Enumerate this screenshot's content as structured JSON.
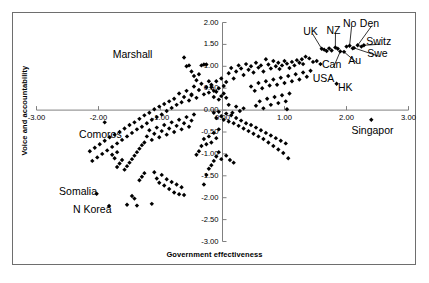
{
  "chart_data": {
    "type": "scatter",
    "title": "",
    "xlabel": "Government effectiveness",
    "ylabel": "Voice and accountability",
    "xlim": [
      -3.0,
      3.0
    ],
    "ylim": [
      -3.0,
      2.0
    ],
    "xticks": [
      "-3.00",
      "-2.00",
      "-1.00",
      "0.00",
      "1.00",
      "2.00",
      "3.00"
    ],
    "xtick_values": [
      -3.0,
      -2.0,
      -1.0,
      0.0,
      1.0,
      2.0,
      3.0
    ],
    "yticks": [
      "2.00",
      "1.50",
      "1.00",
      "0.50",
      "0.00",
      "-0.50",
      "-1.00",
      "-1.50",
      "-2.00",
      "-2.50",
      "-3.00"
    ],
    "ytick_values": [
      2.0,
      1.5,
      1.0,
      0.5,
      0.0,
      -0.5,
      -1.0,
      -1.5,
      -2.0,
      -2.5,
      -3.0
    ],
    "grid": false,
    "legend": "none",
    "marker": "diamond",
    "marker_color": "#000000",
    "axis_color": "#808080",
    "annotations": [
      {
        "label": "Marshall",
        "lx": -1.45,
        "ly": 1.25,
        "px": -0.62,
        "py": 1.2,
        "leader": false
      },
      {
        "label": "Comoros",
        "lx": -1.97,
        "ly": -0.56,
        "px": -1.9,
        "py": -0.28,
        "leader": false
      },
      {
        "label": "Somalia",
        "lx": -2.33,
        "ly": -1.88,
        "px": -2.03,
        "py": -1.91,
        "leader": false
      },
      {
        "label": "N Korea",
        "lx": -2.1,
        "ly": -2.28,
        "px": -1.83,
        "py": -2.19,
        "leader": false
      },
      {
        "label": "Singapor",
        "lx": 2.42,
        "ly": -0.48,
        "px": 2.4,
        "py": -0.22,
        "leader": false
      },
      {
        "label": "UK",
        "lx": 1.42,
        "ly": 1.79,
        "px": 1.6,
        "py": 1.4,
        "leader": true
      },
      {
        "label": "NZ",
        "lx": 1.79,
        "ly": 1.8,
        "px": 1.82,
        "py": 1.43,
        "leader": true
      },
      {
        "label": "No",
        "lx": 2.05,
        "ly": 1.96,
        "px": 2.05,
        "py": 1.47,
        "leader": true
      },
      {
        "label": "Den",
        "lx": 2.37,
        "ly": 1.96,
        "px": 2.18,
        "py": 1.48,
        "leader": true
      },
      {
        "label": "Switz",
        "lx": 2.52,
        "ly": 1.55,
        "px": 2.28,
        "py": 1.48,
        "leader": true
      },
      {
        "label": "Swe",
        "lx": 2.5,
        "ly": 1.27,
        "px": 2.12,
        "py": 1.42,
        "leader": true
      },
      {
        "label": "Au",
        "lx": 2.13,
        "ly": 1.13,
        "px": 1.96,
        "py": 1.33,
        "leader": true
      },
      {
        "label": "Can",
        "lx": 1.76,
        "ly": 1.03,
        "px": 1.9,
        "py": 1.34,
        "leader": true
      },
      {
        "label": "USA",
        "lx": 1.63,
        "ly": 0.72,
        "px": 1.58,
        "py": 1.05,
        "leader": false
      },
      {
        "label": "HK",
        "lx": 1.98,
        "ly": 0.5,
        "px": 1.84,
        "py": 0.6,
        "leader": false
      }
    ],
    "points": [
      [
        -2.03,
        -1.91
      ],
      [
        -1.83,
        -2.19
      ],
      [
        -1.9,
        -0.28
      ],
      [
        -0.62,
        1.2
      ],
      [
        2.4,
        -0.22
      ],
      [
        1.6,
        1.4
      ],
      [
        1.64,
        1.38
      ],
      [
        1.68,
        1.35
      ],
      [
        1.72,
        1.41
      ],
      [
        1.76,
        1.36
      ],
      [
        1.82,
        1.43
      ],
      [
        1.86,
        1.4
      ],
      [
        1.9,
        1.34
      ],
      [
        1.96,
        1.33
      ],
      [
        2.0,
        1.45
      ],
      [
        2.05,
        1.47
      ],
      [
        2.1,
        1.41
      ],
      [
        2.12,
        1.42
      ],
      [
        2.18,
        1.48
      ],
      [
        2.24,
        1.45
      ],
      [
        2.28,
        1.48
      ],
      [
        1.58,
        1.05
      ],
      [
        1.84,
        0.6
      ],
      [
        1.52,
        1.12
      ],
      [
        1.46,
        1.1
      ],
      [
        1.4,
        1.18
      ],
      [
        1.34,
        1.22
      ],
      [
        1.28,
        1.16
      ],
      [
        1.3,
        1.05
      ],
      [
        1.24,
        1.08
      ],
      [
        1.2,
        1.14
      ],
      [
        1.16,
        1.02
      ],
      [
        1.12,
        1.1
      ],
      [
        1.08,
        0.96
      ],
      [
        1.04,
        1.06
      ],
      [
        1.0,
        1.12
      ],
      [
        0.96,
        1.02
      ],
      [
        0.92,
        0.94
      ],
      [
        0.9,
        1.08
      ],
      [
        0.86,
        1.0
      ],
      [
        0.82,
        1.12
      ],
      [
        0.78,
        0.95
      ],
      [
        0.74,
        1.04
      ],
      [
        0.7,
        1.16
      ],
      [
        0.66,
        0.88
      ],
      [
        0.62,
        1.02
      ],
      [
        0.58,
        0.97
      ],
      [
        0.54,
        1.08
      ],
      [
        0.5,
        0.86
      ],
      [
        0.46,
        1.0
      ],
      [
        0.42,
        0.92
      ],
      [
        0.38,
        1.05
      ],
      [
        0.34,
        0.8
      ],
      [
        0.3,
        0.95
      ],
      [
        0.26,
        1.02
      ],
      [
        0.22,
        0.88
      ],
      [
        0.18,
        0.72
      ],
      [
        0.14,
        0.96
      ],
      [
        0.1,
        0.84
      ],
      [
        0.06,
        0.64
      ],
      [
        0.02,
        0.55
      ],
      [
        -0.02,
        0.72
      ],
      [
        -0.06,
        0.5
      ],
      [
        -0.1,
        0.66
      ],
      [
        -0.14,
        0.44
      ],
      [
        -0.18,
        0.58
      ],
      [
        -0.22,
        0.4
      ],
      [
        -0.26,
        0.52
      ],
      [
        -0.3,
        0.36
      ],
      [
        -0.34,
        0.6
      ],
      [
        -0.38,
        0.46
      ],
      [
        -0.42,
        0.28
      ],
      [
        -0.46,
        0.54
      ],
      [
        -0.5,
        0.34
      ],
      [
        -0.54,
        0.22
      ],
      [
        -0.58,
        0.44
      ],
      [
        -0.62,
        0.3
      ],
      [
        -0.66,
        0.18
      ],
      [
        -0.7,
        0.38
      ],
      [
        -0.74,
        0.12
      ],
      [
        -0.78,
        0.26
      ],
      [
        -0.82,
        0.05
      ],
      [
        -0.86,
        0.2
      ],
      [
        -0.9,
        -0.02
      ],
      [
        -0.94,
        0.14
      ],
      [
        -0.98,
        -0.1
      ],
      [
        -1.02,
        0.08
      ],
      [
        -1.06,
        -0.16
      ],
      [
        -1.1,
        0.02
      ],
      [
        -1.14,
        -0.22
      ],
      [
        -1.18,
        -0.06
      ],
      [
        -1.22,
        -0.3
      ],
      [
        -1.26,
        -0.12
      ],
      [
        -1.3,
        -0.38
      ],
      [
        -1.34,
        -0.2
      ],
      [
        -1.38,
        -0.44
      ],
      [
        -1.42,
        -0.28
      ],
      [
        -1.46,
        -0.52
      ],
      [
        -1.5,
        -0.34
      ],
      [
        -1.54,
        -0.6
      ],
      [
        -1.58,
        -0.42
      ],
      [
        -1.62,
        -0.68
      ],
      [
        -1.66,
        -0.5
      ],
      [
        -1.7,
        -0.76
      ],
      [
        -1.74,
        -0.56
      ],
      [
        -1.78,
        -0.84
      ],
      [
        -1.82,
        -0.62
      ],
      [
        -1.86,
        -0.92
      ],
      [
        -1.9,
        -0.7
      ],
      [
        -1.94,
        -1.0
      ],
      [
        -1.98,
        -0.78
      ],
      [
        -2.02,
        -1.08
      ],
      [
        -2.06,
        -0.86
      ],
      [
        -2.1,
        -1.16
      ],
      [
        -2.14,
        -0.94
      ],
      [
        -0.14,
        -0.06
      ],
      [
        -0.1,
        -0.18
      ],
      [
        -0.06,
        -0.04
      ],
      [
        -0.02,
        -0.14
      ],
      [
        0.02,
        -0.22
      ],
      [
        0.06,
        -0.08
      ],
      [
        0.1,
        -0.26
      ],
      [
        0.14,
        -0.12
      ],
      [
        0.18,
        -0.3
      ],
      [
        0.22,
        -0.18
      ],
      [
        0.26,
        -0.36
      ],
      [
        0.3,
        -0.24
      ],
      [
        0.34,
        -0.42
      ],
      [
        0.38,
        -0.3
      ],
      [
        0.42,
        -0.48
      ],
      [
        0.46,
        -0.34
      ],
      [
        0.5,
        -0.54
      ],
      [
        0.54,
        -0.4
      ],
      [
        0.58,
        -0.6
      ],
      [
        0.62,
        -0.46
      ],
      [
        0.66,
        -0.66
      ],
      [
        0.7,
        -0.52
      ],
      [
        0.74,
        -0.74
      ],
      [
        0.78,
        -0.58
      ],
      [
        0.82,
        -0.82
      ],
      [
        0.86,
        -0.64
      ],
      [
        0.9,
        -0.9
      ],
      [
        0.94,
        -0.7
      ],
      [
        0.98,
        -0.98
      ],
      [
        1.02,
        -0.76
      ],
      [
        1.06,
        -1.1
      ],
      [
        0.54,
        0.1
      ],
      [
        0.6,
        0.2
      ],
      [
        0.66,
        0.04
      ],
      [
        0.72,
        0.26
      ],
      [
        0.78,
        0.12
      ],
      [
        0.84,
        0.3
      ],
      [
        0.9,
        0.16
      ],
      [
        0.96,
        0.34
      ],
      [
        1.02,
        0.2
      ],
      [
        1.08,
        0.38
      ],
      [
        0.34,
        0.04
      ],
      [
        0.28,
        -0.02
      ],
      [
        0.22,
        0.08
      ],
      [
        0.16,
        -0.06
      ],
      [
        0.1,
        0.12
      ],
      [
        -0.46,
        -0.1
      ],
      [
        -0.5,
        -0.24
      ],
      [
        -0.54,
        -0.38
      ],
      [
        -0.58,
        -0.16
      ],
      [
        -0.62,
        -0.3
      ],
      [
        -0.66,
        -0.44
      ],
      [
        -0.7,
        -0.22
      ],
      [
        -0.74,
        -0.36
      ],
      [
        -0.78,
        -0.5
      ],
      [
        -0.82,
        -0.28
      ],
      [
        -0.86,
        -0.42
      ],
      [
        -0.9,
        -0.56
      ],
      [
        -0.94,
        -0.34
      ],
      [
        -0.98,
        -0.48
      ],
      [
        -1.02,
        -0.62
      ],
      [
        -1.06,
        -0.4
      ],
      [
        -1.1,
        -0.54
      ],
      [
        -1.14,
        -0.68
      ],
      [
        -1.18,
        -0.46
      ],
      [
        -1.22,
        -0.6
      ],
      [
        -1.26,
        -0.74
      ],
      [
        -1.3,
        -0.8
      ],
      [
        -1.34,
        -0.88
      ],
      [
        -1.38,
        -0.96
      ],
      [
        -1.42,
        -1.04
      ],
      [
        -1.46,
        -1.12
      ],
      [
        -1.5,
        -1.2
      ],
      [
        -1.54,
        -1.28
      ],
      [
        -1.58,
        -1.36
      ],
      [
        -1.62,
        -1.14
      ],
      [
        -1.66,
        -1.22
      ],
      [
        -1.7,
        -1.3
      ],
      [
        -1.26,
        -1.44
      ],
      [
        -1.3,
        -1.52
      ],
      [
        -1.34,
        -1.6
      ],
      [
        -1.1,
        -1.42
      ],
      [
        -1.06,
        -1.56
      ],
      [
        -1.02,
        -1.66
      ],
      [
        -0.98,
        -1.48
      ],
      [
        -0.94,
        -1.72
      ],
      [
        -0.9,
        -1.58
      ],
      [
        -0.86,
        -1.8
      ],
      [
        -0.82,
        -1.64
      ],
      [
        -0.78,
        -1.88
      ],
      [
        -0.74,
        -1.7
      ],
      [
        -0.7,
        -1.92
      ],
      [
        -0.66,
        -1.76
      ],
      [
        -0.62,
        -1.94
      ],
      [
        -1.46,
        -1.96
      ],
      [
        -1.42,
        -2.02
      ],
      [
        -1.38,
        -2.18
      ],
      [
        -1.54,
        -2.16
      ],
      [
        -1.14,
        -2.14
      ],
      [
        -0.3,
        -1.7
      ],
      [
        -0.26,
        -1.48
      ],
      [
        -0.22,
        -1.34
      ],
      [
        -0.18,
        -1.26
      ],
      [
        -0.14,
        -1.16
      ],
      [
        -0.1,
        -1.06
      ],
      [
        -0.06,
        -0.96
      ],
      [
        -0.02,
        -1.12
      ],
      [
        0.06,
        -1.04
      ],
      [
        0.12,
        -1.14
      ],
      [
        0.18,
        -1.2
      ],
      [
        -0.34,
        -0.82
      ],
      [
        -0.38,
        -0.94
      ],
      [
        -0.42,
        -1.02
      ],
      [
        -0.3,
        -0.66
      ],
      [
        -0.26,
        -0.78
      ],
      [
        -0.22,
        -0.6
      ],
      [
        -0.18,
        -0.74
      ],
      [
        -0.14,
        -0.52
      ],
      [
        -0.1,
        -0.64
      ],
      [
        -0.06,
        -0.44
      ],
      [
        0.46,
        0.54
      ],
      [
        0.52,
        0.44
      ],
      [
        0.58,
        0.62
      ],
      [
        0.64,
        0.5
      ],
      [
        0.7,
        0.66
      ],
      [
        0.76,
        0.56
      ],
      [
        0.82,
        0.7
      ],
      [
        0.88,
        0.58
      ],
      [
        0.94,
        0.74
      ],
      [
        1.0,
        0.62
      ],
      [
        1.06,
        0.78
      ],
      [
        1.12,
        0.66
      ],
      [
        1.18,
        0.82
      ],
      [
        1.24,
        0.7
      ],
      [
        1.3,
        0.86
      ],
      [
        1.36,
        0.76
      ],
      [
        1.42,
        0.9
      ],
      [
        1.04,
        0.02
      ],
      [
        -0.02,
        0.32
      ],
      [
        -0.06,
        0.24
      ],
      [
        0.02,
        0.38
      ],
      [
        0.06,
        0.28
      ],
      [
        -1.74,
        -1.1
      ],
      [
        -1.78,
        -1.02
      ],
      [
        -1.7,
        -0.96
      ],
      [
        -0.46,
        0.78
      ],
      [
        -0.5,
        0.88
      ],
      [
        -0.42,
        0.68
      ],
      [
        -0.38,
        0.82
      ],
      [
        -0.34,
        1.02
      ],
      [
        -0.3,
        1.04
      ],
      [
        -0.26,
        1.04
      ],
      [
        -0.54,
        1.02
      ],
      [
        -0.58,
        1.0
      ],
      [
        -0.5,
        0.36
      ],
      [
        -0.18,
        0.52
      ],
      [
        -0.22,
        0.66
      ],
      [
        -0.14,
        0.3
      ],
      [
        -0.1,
        0.42
      ]
    ]
  }
}
